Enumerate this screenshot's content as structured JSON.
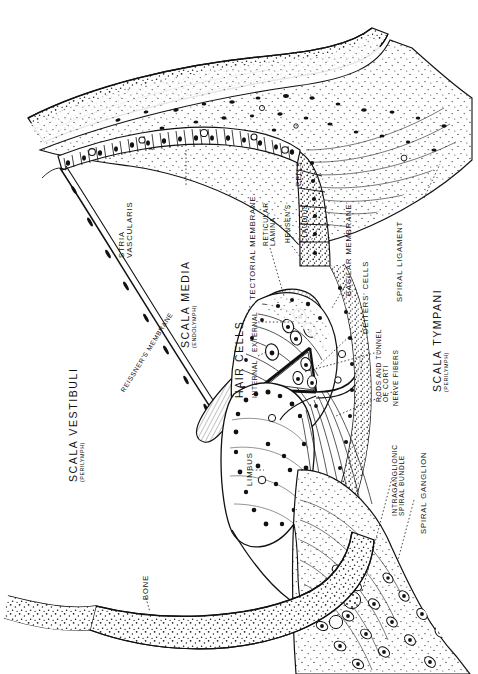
{
  "figure": {
    "type": "anatomical-line-drawing",
    "background_color": "#ffffff",
    "ink_color": "#111111"
  },
  "labels": {
    "scala_vestibuli": {
      "main": "SCALA VESTIBULI",
      "sub": "(PERILYMPH)"
    },
    "reissners_membrane": {
      "main": "REISSNER'S MEMBRANE"
    },
    "stria_vascularis": {
      "line1": "STRIA",
      "line2": "VASCULARIS"
    },
    "scala_media": {
      "main": "SCALA MEDIA",
      "sub": "(ENDOLYMPH)"
    },
    "tectorial_membrane": {
      "main": "TECTORIAL MEMBRANE"
    },
    "reticular_lamina": {
      "line1": "RETICULAR",
      "line2": "LAMINA"
    },
    "hensens": {
      "main": "HENSEN'S"
    },
    "claudius": {
      "main": "CLAUDIUS'"
    },
    "cells": {
      "main": "CELLS"
    },
    "hair_cells": {
      "main": "HAIR CELLS"
    },
    "hair_cells_internal": {
      "main": "INTERNAL"
    },
    "hair_cells_external": {
      "main": "EXTERNAL"
    },
    "limbus": {
      "main": "LIMBUS"
    },
    "bone": {
      "main": "BONE"
    },
    "basilar_membrane": {
      "main": "BASILAR MEMBRANE"
    },
    "deiters_cells": {
      "main": "DEITERS' CELLS"
    },
    "spiral_ligament": {
      "main": "SPIRAL LIGAMENT"
    },
    "rods_and_tunnel": {
      "line1": "RODS AND TUNNEL",
      "line2": "OF CORTI"
    },
    "nerve_fibers": {
      "main": "NERVE FIBERS"
    },
    "scala_tympani": {
      "main": "SCALA TYMPANI",
      "sub": "(PERILYMPH)"
    },
    "intraganglionic": {
      "line1": "INTRAGANGLIONIC",
      "line2": "SPIRAL BUNDLE"
    },
    "spiral_ganglion": {
      "main": "SPIRAL GANGLION"
    }
  }
}
